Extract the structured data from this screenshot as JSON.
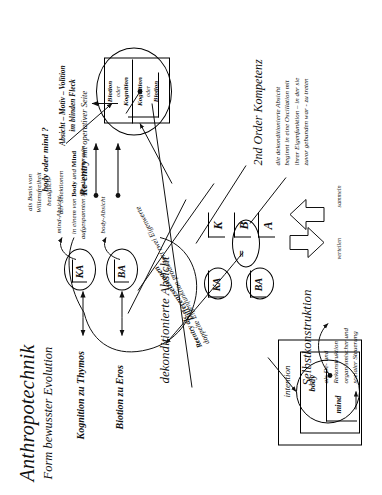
{
  "document": {
    "title": "Anthropotechnik",
    "subtitle": "Form bewusster Evolution",
    "language": "de"
  },
  "eigenvalues": {
    "k_box": "KA",
    "b_box": "BA",
    "k_label": "mind-Absicht",
    "b_label": "body-Absicht",
    "k_driver": "Kognition zu Thymos",
    "b_driver": "Biotion zu Eros"
  },
  "annotations": {
    "dekonditioniert_heading": "dekonditionierte Absicht",
    "dekonditioniert_body_line1": "als Basis von",
    "dekonditioniert_body_line2": "Willensfreiheit",
    "dekonditioniert_body_line3": "bezüglich",
    "dekonditioniert_body_line4": "der Selektionen",
    "dekonditioniert_body_line5_a": "in einem von ",
    "dekonditioniert_body_line5_b": "Body",
    "dekonditioniert_body_line5_c": " und ",
    "dekonditioniert_body_line5_d": "Mind",
    "dekonditioniert_body_line6": "aufgespannten Möglichkeitsraum",
    "second_order_heading": "2nd Order Kompetenz",
    "second_order_line1": "die dekonditionierte Absicht",
    "second_order_line2": "beginnt in eine Oscillation mit",
    "second_order_line3": "ihrer Eigenfunktion – in der sie",
    "second_order_line4": "zuvor gebunden war - zu treten",
    "vollzug_label": "Differenzsetzungen",
    "reentry_heading": "Reentry als",
    "reentry_body": "doppelte Eigenfunktion produziert zwei Eigenwerte",
    "reentry_operativ": "Re-entry",
    "reentry_operativ_rest": " mit operativer Seite",
    "blinder_fleck_line1": "Absicht – Motiv – Volition",
    "blinder_fleck_line2": "im blinden Fleck",
    "body_oder_mind": "body oder mind ?",
    "selbstkonstruktion_heading": "Selbstkonstruktion",
    "selbstkonstruktion_line1": "als De- und",
    "selbstkonstruktion_line2": "Rekonstruktion",
    "selbstkonstruktion_line3": "organismischer und",
    "selbstkonstruktion_line4": "sozialer Steuerung"
  },
  "equation": {
    "left_k": "KA",
    "left_b": "BA",
    "equals": "=",
    "right_k": "K",
    "right_b": "B",
    "right_a": "A",
    "arrow_down_label": "verteilen",
    "arrow_up_label": "sammeln"
  },
  "operator_box": {
    "row_top_line1": "Biotion",
    "row_top_line2": "oder",
    "row_top_line3": "Kognition",
    "row_bottom_line1": "Kognition",
    "row_bottom_line2": "oder",
    "row_bottom_line3": "Biotion"
  },
  "nested_model": {
    "outer": "intention",
    "middle": "body",
    "inner": "mind"
  },
  "colors": {
    "ink": "#111111",
    "paper": "#ffffff"
  }
}
